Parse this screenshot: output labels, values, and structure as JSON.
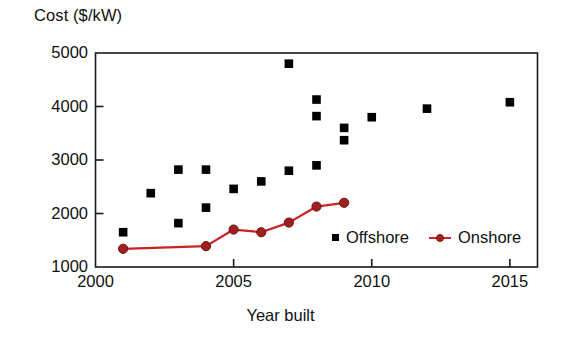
{
  "chart_data": {
    "type": "scatter",
    "title": "",
    "xlabel": "Year built",
    "ylabel": "Cost ($/kW)",
    "xlim": [
      2000,
      2016
    ],
    "ylim": [
      1000,
      5000
    ],
    "xticks": [
      "2000",
      "2005",
      "2010",
      "2015"
    ],
    "xtick_values": [
      2000,
      2005,
      2010,
      2015
    ],
    "yticks": [
      "1000",
      "2000",
      "3000",
      "4000",
      "5000"
    ],
    "ytick_values": [
      1000,
      2000,
      3000,
      4000,
      5000
    ],
    "grid": false,
    "legend_position": "inside lower right",
    "series": [
      {
        "name": "Offshore",
        "type": "scatter",
        "marker": "square",
        "color": "#000000",
        "points": [
          {
            "x": 2001,
            "y": 1650
          },
          {
            "x": 2002,
            "y": 2380
          },
          {
            "x": 2003,
            "y": 2820
          },
          {
            "x": 2003,
            "y": 1820
          },
          {
            "x": 2004,
            "y": 2820
          },
          {
            "x": 2004,
            "y": 2110
          },
          {
            "x": 2005,
            "y": 2460
          },
          {
            "x": 2006,
            "y": 2600
          },
          {
            "x": 2007,
            "y": 4800
          },
          {
            "x": 2007,
            "y": 2800
          },
          {
            "x": 2008,
            "y": 4130
          },
          {
            "x": 2008,
            "y": 3820
          },
          {
            "x": 2008,
            "y": 2900
          },
          {
            "x": 2009,
            "y": 3600
          },
          {
            "x": 2009,
            "y": 3370
          },
          {
            "x": 2010,
            "y": 3800
          },
          {
            "x": 2012,
            "y": 3960
          },
          {
            "x": 2015,
            "y": 4080
          }
        ]
      },
      {
        "name": "Onshore",
        "type": "line",
        "marker": "circle",
        "color": "#cc2222",
        "marker_color": "#a01f1f",
        "points": [
          {
            "x": 2001,
            "y": 1340
          },
          {
            "x": 2004,
            "y": 1390
          },
          {
            "x": 2005,
            "y": 1700
          },
          {
            "x": 2006,
            "y": 1650
          },
          {
            "x": 2007,
            "y": 1830
          },
          {
            "x": 2008,
            "y": 2130
          },
          {
            "x": 2009,
            "y": 2200
          }
        ]
      }
    ]
  },
  "legend": {
    "entries": [
      {
        "label": "Offshore",
        "marker": "square",
        "color": "#000000"
      },
      {
        "label": "Onshore",
        "marker": "circle-line",
        "color": "#cc2222"
      }
    ]
  },
  "colors": {
    "onshore_line": "#cc2222",
    "onshore_marker": "#a01f1f",
    "offshore_marker": "#000000",
    "axis": "#1a1a1a",
    "background": "#ffffff"
  }
}
